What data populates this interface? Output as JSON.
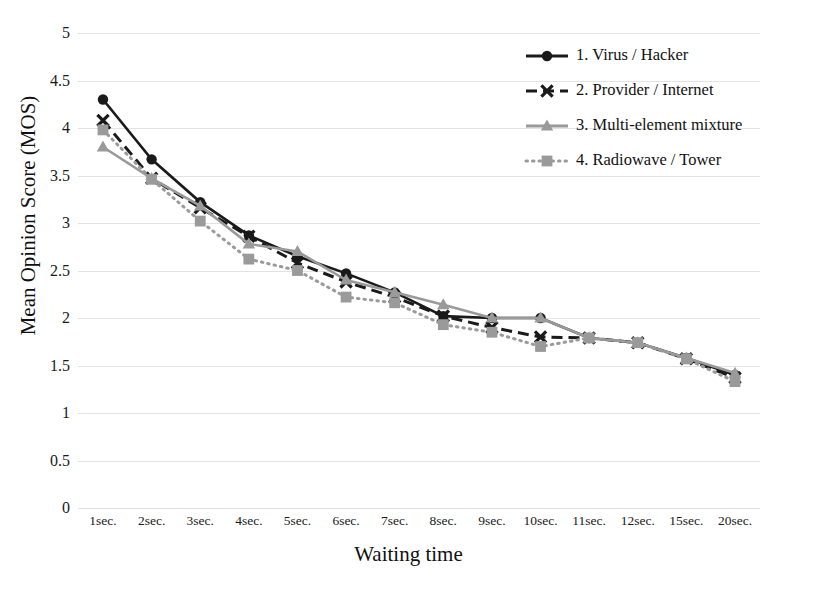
{
  "chart_data": {
    "type": "line",
    "title": "",
    "xlabel": "Waiting time",
    "ylabel": "Mean Opinion Score (MOS)",
    "categories": [
      "1sec.",
      "2sec.",
      "3sec.",
      "4sec.",
      "5sec.",
      "6sec.",
      "7sec.",
      "8sec.",
      "9sec.",
      "10sec.",
      "11sec.",
      "12sec.",
      "15sec.",
      "20sec."
    ],
    "ylim": [
      0,
      5
    ],
    "yticks": [
      "0",
      "0.5",
      "1",
      "1.5",
      "2",
      "2.5",
      "3",
      "3.5",
      "4",
      "4.5",
      "5"
    ],
    "grid": true,
    "legend_position": "top-right",
    "series": [
      {
        "name": "1. Virus / Hacker",
        "marker": "circle",
        "line": "solid",
        "color": "#1a1a1a",
        "values": [
          4.3,
          3.67,
          3.22,
          2.87,
          2.65,
          2.47,
          2.27,
          2.02,
          2.0,
          2.0,
          1.79,
          1.74,
          1.58,
          1.4
        ]
      },
      {
        "name": "2. Provider / Internet",
        "marker": "x",
        "line": "dashed",
        "color": "#1a1a1a",
        "values": [
          4.08,
          3.47,
          3.16,
          2.86,
          2.58,
          2.38,
          2.22,
          2.02,
          1.9,
          1.8,
          1.79,
          1.74,
          1.57,
          1.37
        ]
      },
      {
        "name": "3. Multi-element mixture",
        "marker": "triangle",
        "line": "solid",
        "color": "#9a9a9a",
        "values": [
          3.8,
          3.47,
          3.18,
          2.78,
          2.7,
          2.4,
          2.27,
          2.14,
          2.0,
          2.0,
          1.79,
          1.74,
          1.58,
          1.42
        ]
      },
      {
        "name": "4. Radiowave / Tower",
        "marker": "square",
        "line": "dotted",
        "color": "#9a9a9a",
        "values": [
          3.98,
          3.46,
          3.02,
          2.62,
          2.5,
          2.22,
          2.16,
          1.93,
          1.85,
          1.7,
          1.79,
          1.74,
          1.57,
          1.33
        ]
      }
    ]
  }
}
